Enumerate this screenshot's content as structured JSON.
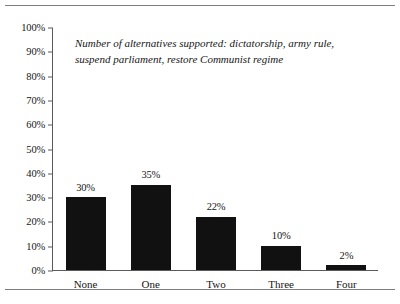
{
  "figure": {
    "has_top_rule": true,
    "has_bottom_rule": true,
    "rule_color": "#7d7d7d"
  },
  "chart_data": {
    "type": "bar",
    "title": "Number of alternatives supported: dictatorship, army rule, suspend parliament, restore Communist regime",
    "title_line1": "Number of alternatives supported: dictatorship, army",
    "title_line2": "rule, suspend parliament, restore Communist regime",
    "xlabel": "",
    "ylabel": "",
    "categories": [
      "None",
      "One",
      "Two",
      "Three",
      "Four"
    ],
    "values": [
      30,
      35,
      22,
      10,
      2
    ],
    "value_labels": [
      "30%",
      "35%",
      "22%",
      "10%",
      "2%"
    ],
    "ylim": [
      0,
      100
    ],
    "ytick_values": [
      0,
      10,
      20,
      30,
      40,
      50,
      60,
      70,
      80,
      90,
      100
    ],
    "ytick_labels": [
      "0%",
      "10%",
      "20%",
      "30%",
      "40%",
      "50%",
      "60%",
      "70%",
      "80%",
      "90%",
      "100%"
    ],
    "grid": false,
    "legend": false,
    "bar_color": "#111111",
    "axis_color": "#5a5a5a"
  }
}
